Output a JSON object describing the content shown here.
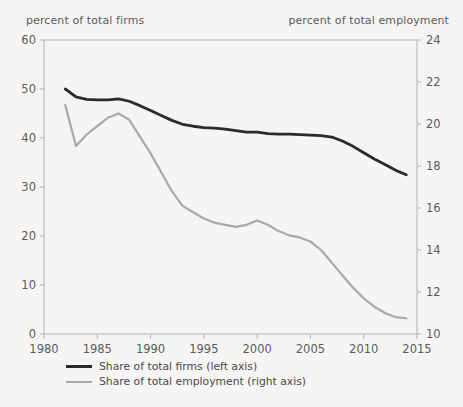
{
  "chart_data": {
    "type": "line",
    "title": "",
    "xlabel": "",
    "ylabel": "percent of total firms",
    "ylabel_right": "percent of total employment",
    "grid": false,
    "legend_position": "bottom-left",
    "xlim": [
      1980,
      2015
    ],
    "ylim": [
      0,
      60
    ],
    "ylim_right": [
      10,
      24
    ],
    "xticks": [
      1980,
      1985,
      1990,
      1995,
      2000,
      2005,
      2010,
      2015
    ],
    "yticks_left": [
      0,
      10,
      20,
      30,
      40,
      50,
      60
    ],
    "yticks_right": [
      10,
      12,
      14,
      16,
      18,
      20,
      22,
      24
    ],
    "series": [
      {
        "name": "Share of total firms (left axis)",
        "axis": "left",
        "color": "#2b2b2b",
        "x": [
          1982,
          1983,
          1984,
          1985,
          1986,
          1987,
          1988,
          1989,
          1990,
          1991,
          1992,
          1993,
          1994,
          1995,
          1996,
          1997,
          1998,
          1999,
          2000,
          2001,
          2002,
          2003,
          2004,
          2005,
          2006,
          2007,
          2008,
          2009,
          2010,
          2011,
          2012,
          2013,
          2014
        ],
        "values": [
          50.0,
          48.4,
          47.9,
          47.8,
          47.8,
          48.0,
          47.5,
          46.6,
          45.6,
          44.6,
          43.6,
          42.8,
          42.4,
          42.1,
          42.0,
          41.8,
          41.5,
          41.2,
          41.2,
          40.9,
          40.8,
          40.8,
          40.7,
          40.6,
          40.5,
          40.2,
          39.4,
          38.3,
          37.0,
          35.7,
          34.6,
          33.4,
          32.5
        ]
      },
      {
        "name": "Share of total employment (right axis)",
        "axis": "right",
        "color": "#a9a9a9",
        "x": [
          1982,
          1983,
          1984,
          1985,
          1986,
          1987,
          1988,
          1989,
          1990,
          1991,
          1992,
          1993,
          1994,
          1995,
          1996,
          1997,
          1998,
          1999,
          2000,
          2001,
          2002,
          2003,
          2004,
          2005,
          2006,
          2007,
          2008,
          2009,
          2010,
          2011,
          2012,
          2013,
          2014
        ],
        "values": [
          20.9,
          18.95,
          19.5,
          19.9,
          20.3,
          20.5,
          20.2,
          19.4,
          18.6,
          17.7,
          16.8,
          16.1,
          15.8,
          15.5,
          15.3,
          15.2,
          15.1,
          15.2,
          15.4,
          15.2,
          14.9,
          14.7,
          14.6,
          14.4,
          14.0,
          13.4,
          12.8,
          12.2,
          11.7,
          11.3,
          11.0,
          10.8,
          10.75
        ]
      }
    ]
  },
  "caption": {
    "left": "percent of total firms",
    "right": "percent of total employment"
  },
  "legend": {
    "items": [
      {
        "label": "Share of total firms (left axis)",
        "color": "#2b2b2b"
      },
      {
        "label": "Share of total employment (right axis)",
        "color": "#a9a9a9"
      }
    ]
  }
}
